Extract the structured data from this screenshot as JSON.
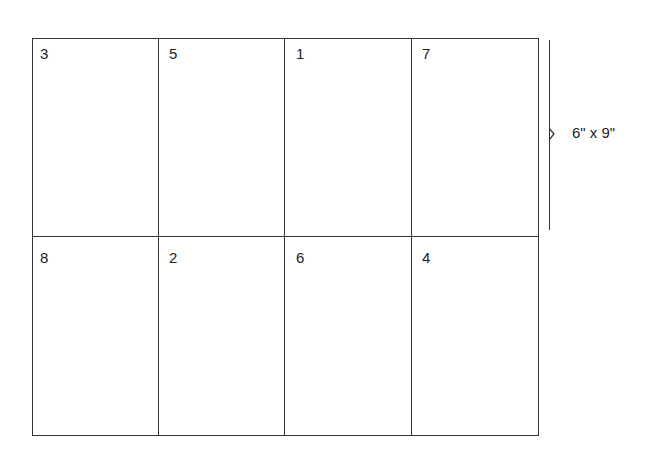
{
  "diagram": {
    "type": "imposition-layout",
    "rows": [
      [
        "3",
        "5",
        "1",
        "7"
      ],
      [
        "8",
        "2",
        "6",
        "4"
      ]
    ],
    "dimension_label": "6\" x 9\""
  }
}
